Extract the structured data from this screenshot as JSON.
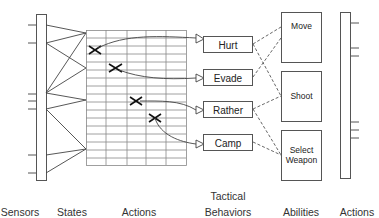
{
  "diagram": {
    "columns": {
      "sensors": "Sensors",
      "states": "States",
      "actions_left": "Actions",
      "tactical_behaviors": "Tactical\nBehaviors",
      "tactical_line1": "Tactical",
      "tactical_line2": "Behaviors",
      "abilities": "Abilities",
      "actions_right": "Actions"
    },
    "tactical_behaviors": [
      {
        "label": "Hurt"
      },
      {
        "label": "Evade"
      },
      {
        "label": "Rather"
      },
      {
        "label": "Camp"
      }
    ],
    "abilities": [
      {
        "label": "Move"
      },
      {
        "label": "Shoot"
      },
      {
        "label": "Select Weapon",
        "line1": "Select",
        "line2": "Weapon"
      }
    ],
    "action_table": {
      "columns": 5,
      "rows": 17,
      "marks": [
        {
          "col": 0,
          "row": 2,
          "target": "Hurt"
        },
        {
          "col": 1,
          "row": 4,
          "target": "Evade"
        },
        {
          "col": 2,
          "row": 8,
          "target": "Rather"
        },
        {
          "col": 3,
          "row": 10,
          "target": "Camp"
        }
      ]
    },
    "behavior_to_ability_links": [
      [
        "Hurt",
        "Move"
      ],
      [
        "Hurt",
        "Shoot"
      ],
      [
        "Evade",
        "Move"
      ],
      [
        "Rather",
        "Shoot"
      ],
      [
        "Rather",
        "Select Weapon"
      ],
      [
        "Camp",
        "Select Weapon"
      ]
    ],
    "colors": {
      "line": "#444444",
      "grid": "#777777",
      "dash": "#555555"
    }
  }
}
